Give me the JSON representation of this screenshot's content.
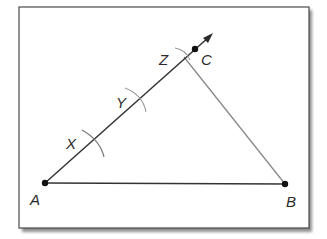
{
  "diagram": {
    "type": "geometric-construction",
    "frame": {
      "x": 19,
      "y": 7,
      "width": 290,
      "height": 221,
      "border_color": "#4a4a4a",
      "shadow_color": "#9a9a9a",
      "background": "#ffffff"
    },
    "points": {
      "A": {
        "label": "A",
        "x": 45,
        "y": 183
      },
      "B": {
        "label": "B",
        "x": 285,
        "y": 184
      },
      "C": {
        "label": "C",
        "x": 195,
        "y": 49
      }
    },
    "segments": [
      {
        "from": "A",
        "to": "B",
        "color": "#333333"
      },
      {
        "from": "C",
        "to": "B",
        "color": "#8a8a8a"
      }
    ],
    "ray": {
      "from": "A",
      "through": "C",
      "arrow_tip": {
        "x": 212,
        "y": 34
      },
      "color": "#333333"
    },
    "arc_marks": [
      {
        "label": "X",
        "on": "ray-AC",
        "x": 95,
        "y": 145
      },
      {
        "label": "Y",
        "on": "ray-AC",
        "x": 139,
        "y": 99
      },
      {
        "label": "Z",
        "on": "ray-AC",
        "x": 185,
        "y": 56
      }
    ],
    "label_positions": {
      "A": {
        "x": 30,
        "y": 205
      },
      "B": {
        "x": 287,
        "y": 207
      },
      "C": {
        "x": 201,
        "y": 65
      },
      "X": {
        "x": 66,
        "y": 148
      },
      "Y": {
        "x": 116,
        "y": 108
      },
      "Z": {
        "x": 159,
        "y": 65
      }
    }
  }
}
